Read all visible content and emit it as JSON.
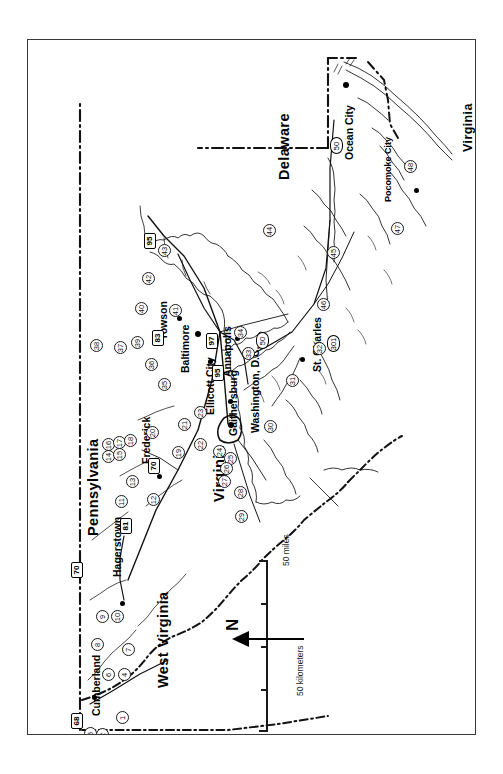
{
  "map": {
    "title": "Maryland reference map",
    "orientation_note": "map rotated 90 degrees counter-clockwise",
    "states": [
      {
        "name": "Pennsylvania",
        "size": "big"
      },
      {
        "name": "West Virginia",
        "size": "big"
      },
      {
        "name": "Virginia",
        "size": "big"
      },
      {
        "name": "Delaware",
        "size": "big"
      },
      {
        "name": "Virginia",
        "size": "med"
      }
    ],
    "cities": [
      {
        "name": "Cumberland"
      },
      {
        "name": "Hagerstown"
      },
      {
        "name": "Frederick"
      },
      {
        "name": "Towson"
      },
      {
        "name": "Baltimore"
      },
      {
        "name": "Ellicott City"
      },
      {
        "name": "Gaithersburg"
      },
      {
        "name": "Annapolis"
      },
      {
        "name": "Washington, D.C."
      },
      {
        "name": "St. Charles"
      },
      {
        "name": "Ocean City"
      },
      {
        "name": "Pocomoke City"
      }
    ],
    "interstates": [
      {
        "number": "68"
      },
      {
        "number": "70"
      },
      {
        "number": "81"
      },
      {
        "number": "83"
      },
      {
        "number": "95"
      },
      {
        "number": "97"
      },
      {
        "number": "95"
      },
      {
        "number": "495"
      }
    ],
    "us_routes": [
      {
        "number": "50"
      },
      {
        "number": "50"
      },
      {
        "number": "301"
      }
    ],
    "county_numbers": [
      "1",
      "2",
      "3",
      "4",
      "5",
      "6",
      "7",
      "8",
      "9",
      "10",
      "11",
      "12",
      "13",
      "14",
      "15",
      "16",
      "17",
      "18",
      "19",
      "20",
      "21",
      "22",
      "23",
      "24",
      "25",
      "26",
      "27",
      "28",
      "29",
      "30",
      "31",
      "32",
      "33",
      "34",
      "35",
      "36",
      "37",
      "38",
      "39",
      "40",
      "41",
      "42",
      "43",
      "44",
      "45",
      "46",
      "47",
      "48"
    ],
    "scale": {
      "miles_label": "50 miles",
      "kilometers_label": "50 kilometers",
      "zero_miles": "0",
      "zero_km": "0"
    },
    "north_arrow": {
      "label": "N"
    },
    "colors": {
      "frame": "#3a3a3a",
      "ink": "#000000",
      "water": "#ffffff",
      "paper": "#ffffff"
    }
  }
}
